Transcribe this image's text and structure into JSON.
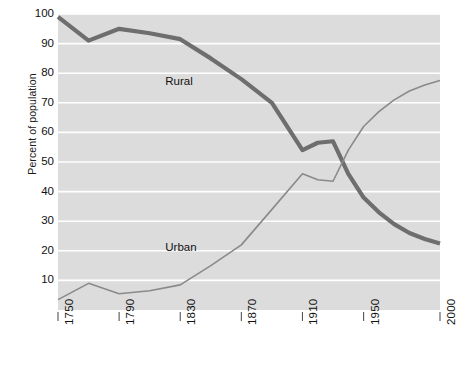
{
  "chart_data": {
    "type": "line",
    "title": "",
    "subtitle": "",
    "xlabel": "",
    "ylabel": "Percent of population",
    "xlim": [
      1750,
      2000
    ],
    "ylim": [
      0,
      100
    ],
    "grid": true,
    "grid_orientation": "horizontal",
    "legend_position": "inline-annotation",
    "x_ticks": [
      1750,
      1790,
      1830,
      1870,
      1910,
      1950,
      2000
    ],
    "x_tick_labels": [
      "1750",
      "1790",
      "1830",
      "1870",
      "1910",
      "1950",
      "2000"
    ],
    "y_ticks": [
      10,
      20,
      30,
      40,
      50,
      60,
      70,
      80,
      90,
      100
    ],
    "y_tick_labels": [
      "10",
      "20",
      "30",
      "40",
      "50",
      "60",
      "70",
      "80",
      "90",
      "100"
    ],
    "series": [
      {
        "name": "Rural",
        "color": "#6e6e6e",
        "line_width": 4.2,
        "label_position": {
          "x": 1832,
          "y": 77
        },
        "x": [
          1750,
          1770,
          1790,
          1810,
          1830,
          1850,
          1870,
          1890,
          1910,
          1920,
          1930,
          1940,
          1950,
          1960,
          1970,
          1980,
          1990,
          2000
        ],
        "y": [
          99,
          91,
          95,
          93.5,
          91.5,
          85,
          78,
          70,
          54,
          56.5,
          57,
          46,
          38,
          33,
          29,
          26,
          24,
          22.5
        ]
      },
      {
        "name": "Urban",
        "color": "#8a8a8a",
        "line_width": 1.6,
        "label_position": {
          "x": 1832,
          "y": 21
        },
        "x": [
          1750,
          1770,
          1790,
          1810,
          1830,
          1850,
          1870,
          1890,
          1910,
          1920,
          1930,
          1940,
          1950,
          1960,
          1970,
          1980,
          1990,
          2000
        ],
        "y": [
          3.5,
          9,
          5.5,
          6.5,
          8.5,
          15,
          22,
          34,
          46,
          44,
          43.5,
          54,
          62,
          67,
          71,
          74,
          76,
          77.5
        ]
      }
    ],
    "colors": {
      "plot_background": "#dcdcdc",
      "gridline": "#ffffff",
      "page_background": "#ffffff",
      "text": "#111111",
      "axis": "#555555"
    }
  }
}
